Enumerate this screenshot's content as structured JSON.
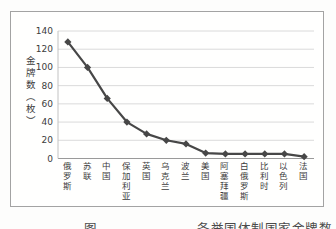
{
  "figure": {
    "caption": {
      "label": "图",
      "title": "各举国体制国家金牌数"
    }
  },
  "chart_data": {
    "type": "line",
    "title": "",
    "xlabel": "",
    "ylabel": "金牌数（枚）",
    "categories": [
      "俄罗斯",
      "苏联",
      "中国",
      "保加利亚",
      "英国",
      "乌克兰",
      "波兰",
      "美国",
      "阿塞拜疆",
      "白俄罗斯",
      "比利时",
      "以色列",
      "法国"
    ],
    "values": [
      128,
      100,
      66,
      40,
      27,
      20,
      16,
      6,
      5,
      5,
      5,
      5,
      2
    ],
    "ylim": [
      0,
      140
    ],
    "yticks": [
      0,
      20,
      40,
      60,
      80,
      100,
      120,
      140
    ],
    "grid": "horizontal",
    "legend": "none",
    "marker": "diamond",
    "colors": {
      "line": "#474747",
      "marker": "#474747",
      "gridline": "#dadada",
      "x_axis_line": "#9a9a9a",
      "y_axis_line": "#c2c2c2",
      "text": "#3c3c3c",
      "border": "#a3a3a3"
    }
  }
}
